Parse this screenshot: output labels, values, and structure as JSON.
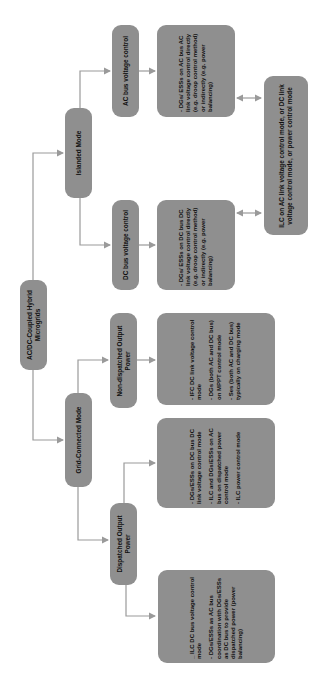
{
  "diagram": {
    "root": {
      "label": "AC/DC-Coupled Hybrid Microgrids"
    },
    "modes": [
      {
        "label": "Islanded Mode"
      },
      {
        "label": "Grid-Connected Mode"
      }
    ],
    "islanded": {
      "ac_bus": {
        "label": "AC bus voltage control",
        "detail": [
          "- DGs/ ESSs on AC bus AC link voltage control directly (e.g. droop control method) or indirectly (e.g. power balancing)"
        ]
      },
      "dc_bus": {
        "label": "DC bus voltage control",
        "detail": [
          "- DGs/ ESSs on DC bus DC link voltage control directly (e.g. droop control method) or indirectly (e.g. power balancing)"
        ]
      },
      "ilc": {
        "label": "ILC on AC link voltage control mode, or DC link voltage control mode, or power control mode"
      }
    },
    "grid_connected": {
      "non_dispatched": {
        "label": "Non-dispatched Output Power",
        "detail": [
          "- IFC DC link voltage control mode",
          "- DGs (both AC and DC bus) on MPPT control mode",
          "- Ses (both AC and DC bus) typically on charging mode"
        ]
      },
      "dispatched": {
        "label": "Dispatched Output Power",
        "detail_dc": [
          "- DGs/ESSs on DC bus DC link voltage control mode",
          "- ILC and DGs/ESSs on AC bus on dispatched power control mode",
          "- ILC power control mode"
        ],
        "detail_ilc": [
          "_ ILC DC bus voltage control mode",
          "- DGs/ESSs as AC bus coordination with DGs/ESSs as DC bus to provide dispatched power (power balancing)"
        ]
      }
    },
    "colors": {
      "box_fill": "#8f8f8f",
      "line": "#9a9a9a",
      "text": "#111111"
    }
  }
}
